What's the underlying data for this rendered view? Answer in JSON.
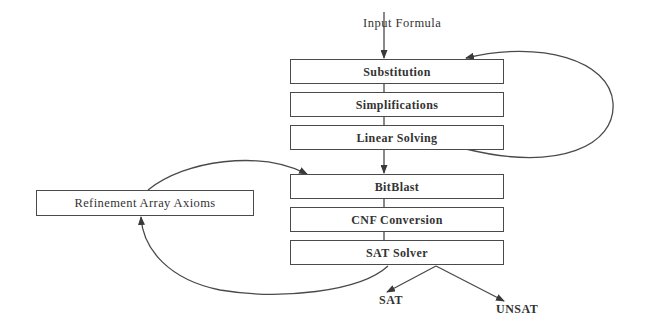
{
  "diagram": {
    "type": "flowchart",
    "input_label": "Input Formula",
    "stages": [
      {
        "id": "substitution",
        "label": "Substitution"
      },
      {
        "id": "simplifications",
        "label": "Simplifications"
      },
      {
        "id": "linear-solving",
        "label": "Linear Solving"
      },
      {
        "id": "bitblast",
        "label": "BitBlast"
      },
      {
        "id": "cnf-conversion",
        "label": "CNF Conversion"
      },
      {
        "id": "sat-solver",
        "label": "SAT Solver"
      }
    ],
    "side_box": {
      "id": "refinement",
      "label": "Refinement Array Axioms"
    },
    "outputs": [
      {
        "id": "sat",
        "label": "SAT"
      },
      {
        "id": "unsat",
        "label": "UNSAT"
      }
    ],
    "edges": [
      {
        "from": "input",
        "to": "substitution"
      },
      {
        "from": "substitution",
        "to": "simplifications"
      },
      {
        "from": "simplifications",
        "to": "linear-solving"
      },
      {
        "from": "linear-solving",
        "to": "substitution",
        "kind": "loop"
      },
      {
        "from": "linear-solving",
        "to": "bitblast"
      },
      {
        "from": "bitblast",
        "to": "cnf-conversion"
      },
      {
        "from": "cnf-conversion",
        "to": "sat-solver"
      },
      {
        "from": "sat-solver",
        "to": "refinement",
        "kind": "loop"
      },
      {
        "from": "refinement",
        "to": "bitblast",
        "kind": "loop"
      },
      {
        "from": "sat-solver",
        "to": "sat"
      },
      {
        "from": "sat-solver",
        "to": "unsat"
      }
    ],
    "colors": {
      "line": "#4a4a4a",
      "text": "#333333",
      "background": "#ffffff"
    }
  }
}
